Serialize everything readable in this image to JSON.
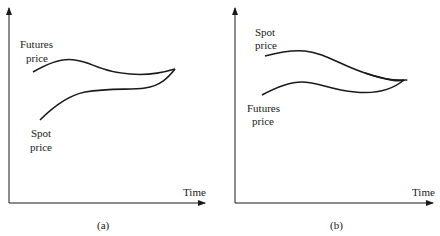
{
  "panels": [
    {
      "id": "a",
      "caption": "(a)",
      "x_axis_label": "Time",
      "upper_curve_label": [
        "Futures",
        "price"
      ],
      "lower_curve_label": [
        "Spot",
        "price"
      ],
      "description": "Futures price above spot price, converging at maturity"
    },
    {
      "id": "b",
      "caption": "(b)",
      "x_axis_label": "Time",
      "upper_curve_label": [
        "Spot",
        "price"
      ],
      "lower_curve_label": [
        "Futures",
        "price"
      ],
      "description": "Spot price above futures price, converging at maturity"
    }
  ],
  "colors": {
    "line": "#1a1a1a",
    "background": "#ffffff"
  }
}
